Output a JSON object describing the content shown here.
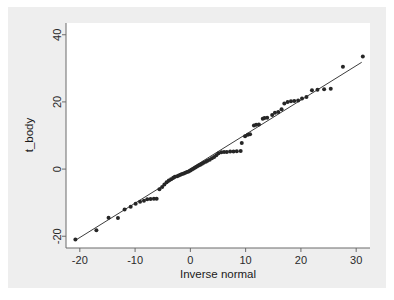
{
  "figure": {
    "background_color": "#ffffff",
    "panel_color": "#eeeeee",
    "plot_area_color": "#ffffff",
    "marker_color": "#262626",
    "line_color": "#262626",
    "axis_color": "#6b6b6b"
  },
  "chart_data": {
    "type": "scatter",
    "title": "",
    "subtitle": "",
    "xlabel": "Inverse normal",
    "ylabel": "t_body",
    "xlim": [
      -22.5,
      32.5
    ],
    "ylim": [
      -23.5,
      43.5
    ],
    "xticks": [
      -20,
      -10,
      0,
      10,
      20,
      30
    ],
    "xticklabels": [
      "-20",
      "-10",
      "0",
      "10",
      "20",
      "30"
    ],
    "yticks": [
      -20,
      0,
      20,
      40
    ],
    "yticklabels": [
      "-20",
      "0",
      "20",
      "40"
    ],
    "grid": false,
    "legend": null,
    "series": [
      {
        "name": "t_body quantiles",
        "type": "scatter",
        "marker": "filled-circle",
        "marker_size": 4,
        "color": "#262626",
        "points": [
          [
            -20.8,
            -21.0
          ],
          [
            -17.0,
            -18.2
          ],
          [
            -14.8,
            -14.5
          ],
          [
            -13.1,
            -14.6
          ],
          [
            -11.9,
            -12.0
          ],
          [
            -10.8,
            -11.2
          ],
          [
            -9.9,
            -10.3
          ],
          [
            -9.1,
            -9.7
          ],
          [
            -8.4,
            -9.4
          ],
          [
            -7.8,
            -9.0
          ],
          [
            -7.2,
            -8.9
          ],
          [
            -6.6,
            -8.8
          ],
          [
            -6.1,
            -8.8
          ],
          [
            -5.6,
            -6.0
          ],
          [
            -5.1,
            -5.3
          ],
          [
            -4.7,
            -4.6
          ],
          [
            -4.3,
            -3.9
          ],
          [
            -3.9,
            -3.4
          ],
          [
            -3.5,
            -3.0
          ],
          [
            -3.1,
            -2.6
          ],
          [
            -2.8,
            -2.3
          ],
          [
            -2.4,
            -2.1
          ],
          [
            -2.1,
            -1.9
          ],
          [
            -1.8,
            -1.7
          ],
          [
            -1.5,
            -1.5
          ],
          [
            -1.2,
            -1.3
          ],
          [
            -0.9,
            -1.1
          ],
          [
            -0.6,
            -0.9
          ],
          [
            -0.3,
            -0.7
          ],
          [
            0.0,
            -0.4
          ],
          [
            0.3,
            -0.1
          ],
          [
            0.6,
            0.2
          ],
          [
            0.9,
            0.5
          ],
          [
            1.2,
            0.8
          ],
          [
            1.5,
            1.1
          ],
          [
            1.8,
            1.3
          ],
          [
            2.1,
            1.6
          ],
          [
            2.4,
            1.9
          ],
          [
            2.8,
            2.2
          ],
          [
            3.1,
            2.5
          ],
          [
            3.5,
            2.8
          ],
          [
            3.9,
            3.2
          ],
          [
            4.3,
            3.6
          ],
          [
            4.7,
            4.1
          ],
          [
            5.1,
            4.7
          ],
          [
            5.6,
            5.0
          ],
          [
            6.1,
            5.1
          ],
          [
            6.6,
            5.1
          ],
          [
            7.2,
            5.2
          ],
          [
            7.8,
            5.2
          ],
          [
            8.4,
            5.3
          ],
          [
            9.1,
            5.4
          ],
          [
            9.3,
            7.8
          ],
          [
            9.9,
            9.8
          ],
          [
            10.4,
            10.2
          ],
          [
            10.8,
            10.4
          ],
          [
            11.5,
            13.0
          ],
          [
            11.9,
            13.2
          ],
          [
            12.4,
            13.3
          ],
          [
            13.1,
            15.0
          ],
          [
            13.4,
            15.2
          ],
          [
            13.9,
            15.3
          ],
          [
            14.8,
            16.1
          ],
          [
            15.3,
            16.8
          ],
          [
            15.9,
            17.0
          ],
          [
            16.5,
            17.8
          ],
          [
            17.0,
            19.5
          ],
          [
            17.6,
            20.0
          ],
          [
            18.2,
            20.2
          ],
          [
            18.8,
            20.3
          ],
          [
            19.5,
            20.4
          ],
          [
            20.2,
            21.0
          ],
          [
            21.0,
            21.5
          ],
          [
            22.0,
            23.5
          ],
          [
            23.0,
            23.6
          ],
          [
            24.2,
            23.8
          ],
          [
            25.4,
            23.9
          ],
          [
            27.6,
            30.5
          ],
          [
            31.2,
            33.5
          ]
        ]
      },
      {
        "name": "reference line",
        "type": "line",
        "color": "#262626",
        "x": [
          -20.8,
          31.0
        ],
        "y": [
          -21.2,
          31.8
        ]
      }
    ]
  }
}
